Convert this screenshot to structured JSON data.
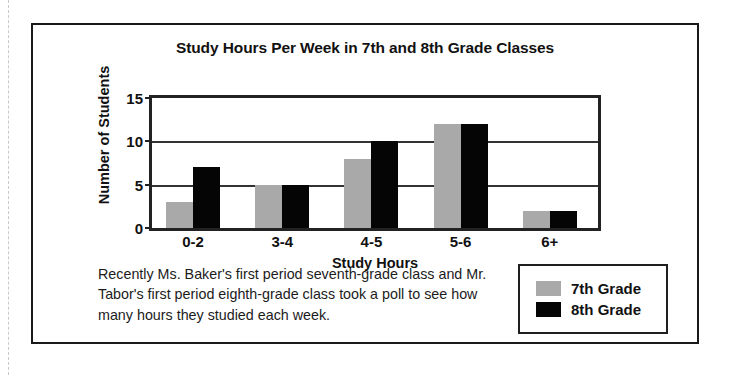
{
  "chart_data": {
    "type": "bar",
    "title": "Study Hours Per Week in 7th and 8th Grade Classes",
    "xlabel": "Study Hours",
    "ylabel": "Number of Students",
    "categories": [
      "0-2",
      "3-4",
      "4-5",
      "5-6",
      "6+"
    ],
    "series": [
      {
        "name": "7th Grade",
        "color": "#a9a9a9",
        "values": [
          3,
          5,
          8,
          12,
          2
        ]
      },
      {
        "name": "8th Grade",
        "color": "#050505",
        "values": [
          7,
          5,
          10,
          12,
          2
        ]
      }
    ],
    "ylim": [
      0,
      15
    ],
    "yticks": [
      0,
      5,
      10,
      15
    ],
    "ytick_labels": [
      "0",
      "5",
      "10",
      "15"
    ],
    "grid": true,
    "legend_position": "bottom-right"
  },
  "caption": {
    "text": "Recently Ms. Baker's first period seventh-grade class and Mr. Tabor's first period eighth-grade class took a poll to see how many hours they studied each week."
  },
  "legend": {
    "items": [
      {
        "label": "7th Grade",
        "swatch": "gray-swatch-icon"
      },
      {
        "label": "8th Grade",
        "swatch": "black-swatch-icon"
      }
    ]
  }
}
